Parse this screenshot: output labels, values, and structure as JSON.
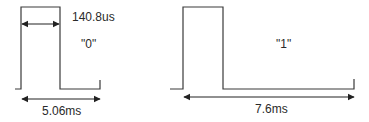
{
  "diagram": {
    "bit0": {
      "label": "\"0\"",
      "pulse_width_label": "140.8us",
      "period_label": "5.06ms"
    },
    "bit1": {
      "label": "\"1\"",
      "period_label": "7.6ms"
    },
    "colors": {
      "line": "#3a3a3a",
      "text": "#2a2a2a",
      "background": "#ffffff"
    }
  }
}
